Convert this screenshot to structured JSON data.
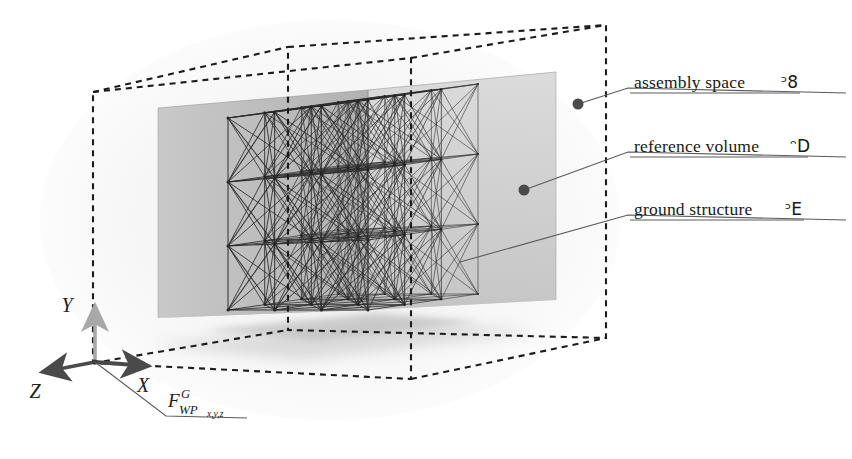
{
  "figure": {
    "width": 852,
    "height": 459,
    "background_color": "#ffffff"
  },
  "annotations": [
    {
      "id": "assembly-space",
      "text": "assembly space",
      "symbol": "ᵓ8",
      "symbol_name": "blackboard-bold-A",
      "label_x": 634,
      "label_y": 88,
      "underline_x1": 630,
      "underline_x2": 846,
      "underline_y": 93,
      "leader": [
        [
          578,
          104
        ],
        [
          628,
          88
        ]
      ],
      "dot": [
        578,
        104
      ],
      "dot_radius": 5.5
    },
    {
      "id": "reference-volume",
      "text": "reference volume",
      "symbol": "ᵔD",
      "symbol_name": "blackboard-bold-V",
      "label_x": 634,
      "label_y": 152,
      "underline_x1": 630,
      "underline_x2": 846,
      "underline_y": 157,
      "leader": [
        [
          524,
          190
        ],
        [
          628,
          152
        ]
      ],
      "dot": [
        524,
        190
      ],
      "dot_radius": 5.5
    },
    {
      "id": "ground-structure",
      "text": "ground structure",
      "symbol": "ᵓE",
      "symbol_name": "blackboard-bold-G",
      "label_x": 634,
      "label_y": 215,
      "underline_x1": 630,
      "underline_x2": 846,
      "underline_y": 220,
      "leader": [
        [
          460,
          262
        ],
        [
          628,
          215
        ]
      ],
      "dot": null,
      "dot_radius": 0
    }
  ],
  "axes": {
    "origin": [
      95,
      362
    ],
    "items": [
      {
        "id": "x",
        "label": "X",
        "tip": [
          152,
          366
        ],
        "label_x": 143,
        "label_y": 392,
        "color": "#4a4a4a"
      },
      {
        "id": "y",
        "label": "Y",
        "tip": [
          95,
          303
        ],
        "label_x": 67,
        "label_y": 312,
        "color": "#a8a8a8"
      },
      {
        "id": "z",
        "label": "Z",
        "tip": [
          38,
          373
        ],
        "label_x": 35,
        "label_y": 398,
        "color": "#4a4a4a"
      }
    ],
    "frame_label": {
      "base": "F",
      "superscript": "G",
      "subscript": "WP",
      "subsubscript": "x,y,z",
      "leader": [
        [
          95,
          362
        ],
        [
          166,
          416
        ]
      ],
      "underline_x1": 163,
      "underline_x2": 247,
      "underline_y": 418,
      "x": 168,
      "y": 405
    }
  },
  "assembly_space_box": {
    "name": "assembly-space-box",
    "style": "dashed",
    "stroke": "#1c1c1c",
    "dash": "6,5",
    "stroke_width": 2.1,
    "front_face": [
      [
        93,
        363
      ],
      [
        93,
        92
      ],
      [
        411,
        58
      ],
      [
        411,
        379
      ]
    ],
    "back_offset": [
      195,
      -45
    ],
    "vertices_front": [
      [
        93,
        92
      ],
      [
        411,
        58
      ],
      [
        411,
        379
      ],
      [
        93,
        363
      ]
    ],
    "vertices_back": [
      [
        288,
        47
      ],
      [
        606,
        25
      ],
      [
        606,
        338
      ],
      [
        288,
        330
      ]
    ]
  },
  "reference_volume_box": {
    "name": "reference-volume-box",
    "fill_left": "#b9b9b9",
    "fill_right": "#cfcfcf",
    "fill_floor": "#dcdcdc",
    "stroke": "#8e8e8e",
    "front_face": [
      [
        158,
        318
      ],
      [
        158,
        108
      ],
      [
        368,
        90
      ],
      [
        368,
        310
      ]
    ],
    "back_face": [
      [
        345,
        295
      ],
      [
        345,
        78
      ],
      [
        556,
        72
      ],
      [
        556,
        300
      ]
    ]
  },
  "ground_structure": {
    "name": "ground-structure-lattice",
    "nodes_per_edge": 4,
    "total_nodes": 64,
    "stroke": "#2a2a2a",
    "stroke_width": 1.05,
    "front_face": [
      [
        228,
        310
      ],
      [
        228,
        118
      ],
      [
        368,
        100
      ],
      [
        368,
        296
      ]
    ],
    "depth_offset": [
      110,
      -16
    ],
    "origin_x": 228,
    "origin_y": 310,
    "size_x": 140,
    "size_y": -192,
    "dx_depth": 110,
    "dy_depth": -16,
    "skew_top": -18,
    "bracing": "full face and space diagonals"
  },
  "ground_shadow": {
    "name": "ground-shadow",
    "color": "#c9c9c9",
    "polygon": [
      [
        150,
        340
      ],
      [
        400,
        318
      ],
      [
        520,
        330
      ],
      [
        300,
        355
      ]
    ]
  },
  "paper_texture": {
    "enabled": true,
    "tone": "#f4f4f4",
    "noise_opacity": 0.16
  }
}
